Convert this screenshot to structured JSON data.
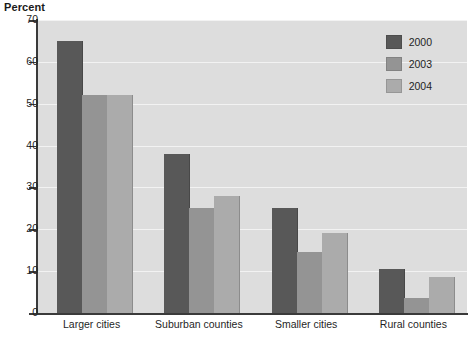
{
  "chart_data": {
    "type": "bar",
    "title": "Percent",
    "xlabel": "",
    "ylabel": "Percent",
    "ylim": [
      0,
      70
    ],
    "yticks": [
      0,
      10,
      20,
      30,
      40,
      50,
      60,
      70
    ],
    "grid": true,
    "legend_position": "top-right",
    "categories": [
      "Larger cities",
      "Suburban counties",
      "Smaller cities",
      "Rural counties"
    ],
    "series": [
      {
        "name": "2000",
        "color": "#585858",
        "values": [
          65,
          38,
          25,
          10.5
        ]
      },
      {
        "name": "2003",
        "color": "#949494",
        "values": [
          52,
          25,
          14.5,
          3.5
        ]
      },
      {
        "name": "2004",
        "color": "#ababab",
        "values": [
          52,
          28,
          19,
          8.5
        ]
      }
    ]
  },
  "style": {
    "plot_background": "#dddddd",
    "gridline_color": "#f2f2f2",
    "axis_color": "#3a3a3a",
    "text_color": "#1f1f1f"
  }
}
